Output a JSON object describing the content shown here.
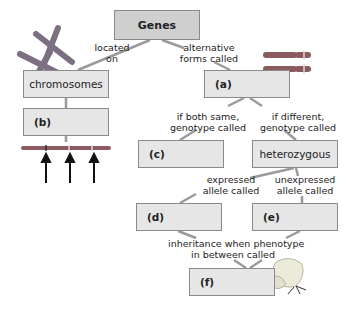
{
  "diagram": {
    "nodes": {
      "genes": "Genes",
      "chromosomes": "chromosomes",
      "a": "(a)",
      "b": "(b)",
      "c": "(c)",
      "heterozygous": "heterozygous",
      "d": "(d)",
      "e": "(e)",
      "f": "(f)"
    },
    "edges": {
      "located_on_1": "located",
      "located_on_2": "on",
      "alt_forms_1": "alternative",
      "alt_forms_2": "forms called",
      "specific_loc_1": "at specific",
      "specific_loc_2": "locations called",
      "both_same_1": "if both same,",
      "both_same_2": "genotype called",
      "different_1": "if different,",
      "different_2": "genotype called",
      "expressed_1": "expressed",
      "expressed_2": "allele called",
      "unexpressed_1": "unexpressed",
      "unexpressed_2": "allele called",
      "inheritance_1": "inheritance when phenotype",
      "inheritance_2": "in between called"
    },
    "illustrations": [
      "chromosome-pair-icon",
      "homologous-chromosomes-icon",
      "chromosome-loci-icon",
      "snapdragon-flower-icon"
    ],
    "colors": {
      "box_fill": "#e6e6e6",
      "top_box_fill": "#cfcfcf",
      "border": "#8a8a8a",
      "connector": "#9a9a9a",
      "chromosome": "#8a5a5e"
    }
  }
}
